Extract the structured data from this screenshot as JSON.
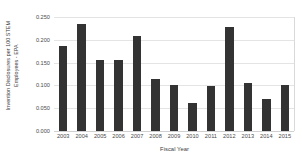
{
  "chart_data": {
    "type": "bar",
    "title": "",
    "xlabel": "Fiscal Year",
    "ylabel_lines": [
      "Invention Disclosures per 100 STEM",
      "Employees - EPA"
    ],
    "ylabel": "Invention Disclosures per 100 STEM Employees - EPA",
    "categories": [
      "2003",
      "2004",
      "2005",
      "2006",
      "2007",
      "2008",
      "2009",
      "2010",
      "2011",
      "2012",
      "2013",
      "2014",
      "2015"
    ],
    "values": [
      0.186,
      0.235,
      0.156,
      0.155,
      0.208,
      0.115,
      0.101,
      0.061,
      0.099,
      0.228,
      0.106,
      0.071,
      0.1
    ],
    "ylim": [
      0.0,
      0.25
    ],
    "ytick_values": [
      0.0,
      0.05,
      0.1,
      0.15,
      0.2,
      0.25
    ],
    "ytick_labels": [
      "0.000",
      "0.050",
      "0.100",
      "0.150",
      "0.200",
      "0.250"
    ],
    "grid": "horizontal",
    "legend": "none",
    "bar_color": "#333333",
    "gridline_color": "#e4e4e4",
    "axis_text_color": "#4a4a4a"
  }
}
